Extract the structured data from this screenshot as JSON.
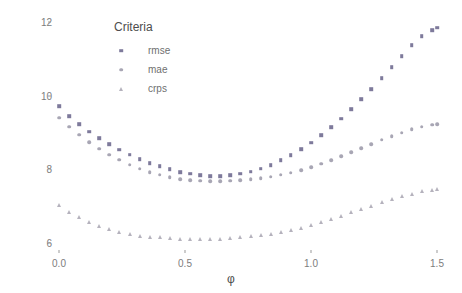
{
  "chart_data": {
    "type": "scatter",
    "title": "",
    "xlabel": "φ",
    "ylabel": "criteria value",
    "xlim": [
      -0.04,
      1.56
    ],
    "ylim": [
      5.55,
      12.25
    ],
    "xticks": [
      "0.0",
      "0.5",
      "1.0",
      "1.5"
    ],
    "xtick_values": [
      0.0,
      0.5,
      1.0,
      1.5
    ],
    "yticks": [
      "6",
      "8",
      "10",
      "12"
    ],
    "ytick_values": [
      6,
      8,
      10,
      12
    ],
    "grid": false,
    "legend": {
      "title": "Criteria",
      "position": "top-left-inside",
      "entries": [
        {
          "label": "rmse",
          "color": "#7e7a9b",
          "marker": "square"
        },
        {
          "label": "mae",
          "color": "#a8a6b4",
          "marker": "circle"
        },
        {
          "label": "crps",
          "color": "#b5b2bd",
          "marker": "triangle"
        }
      ]
    },
    "x": [
      0.0,
      0.04,
      0.08,
      0.12,
      0.16,
      0.2,
      0.24,
      0.28,
      0.32,
      0.36,
      0.4,
      0.44,
      0.48,
      0.52,
      0.56,
      0.6,
      0.64,
      0.68,
      0.72,
      0.76,
      0.8,
      0.84,
      0.88,
      0.92,
      0.96,
      1.0,
      1.04,
      1.08,
      1.12,
      1.16,
      1.2,
      1.24,
      1.28,
      1.32,
      1.36,
      1.4,
      1.44,
      1.48,
      1.5
    ],
    "series": [
      {
        "name": "rmse",
        "color": "#7e7a9b",
        "marker": "square",
        "values": [
          9.72,
          9.45,
          9.22,
          9.02,
          8.84,
          8.68,
          8.53,
          8.4,
          8.28,
          8.17,
          8.08,
          8.0,
          7.93,
          7.88,
          7.84,
          7.82,
          7.82,
          7.84,
          7.88,
          7.94,
          8.02,
          8.12,
          8.24,
          8.38,
          8.54,
          8.72,
          8.92,
          9.14,
          9.38,
          9.63,
          9.9,
          10.18,
          10.47,
          10.77,
          11.07,
          11.37,
          11.62,
          11.78,
          11.84
        ]
      },
      {
        "name": "mae",
        "color": "#a8a6b4",
        "marker": "circle",
        "values": [
          9.4,
          9.16,
          8.94,
          8.74,
          8.56,
          8.4,
          8.26,
          8.13,
          8.02,
          7.93,
          7.85,
          7.79,
          7.74,
          7.71,
          7.69,
          7.68,
          7.68,
          7.69,
          7.71,
          7.73,
          7.76,
          7.8,
          7.85,
          7.91,
          7.98,
          8.06,
          8.15,
          8.25,
          8.36,
          8.47,
          8.58,
          8.69,
          8.8,
          8.9,
          9.0,
          9.09,
          9.16,
          9.21,
          9.23
        ]
      },
      {
        "name": "crps",
        "color": "#b5b2bd",
        "marker": "triangle",
        "values": [
          7.03,
          6.85,
          6.7,
          6.57,
          6.46,
          6.37,
          6.3,
          6.24,
          6.2,
          6.17,
          6.15,
          6.13,
          6.12,
          6.11,
          6.11,
          6.11,
          6.12,
          6.13,
          6.15,
          6.18,
          6.21,
          6.25,
          6.3,
          6.36,
          6.42,
          6.49,
          6.57,
          6.65,
          6.74,
          6.83,
          6.92,
          7.01,
          7.1,
          7.19,
          7.27,
          7.34,
          7.4,
          7.44,
          7.46
        ]
      }
    ]
  }
}
